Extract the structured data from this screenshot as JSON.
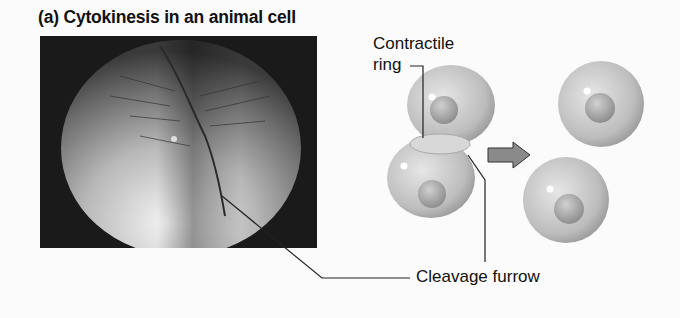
{
  "figure": {
    "title": "(a) Cytokinesis in an animal cell",
    "labels": {
      "contractile_ring_line1": "Contractile",
      "contractile_ring_line2": "ring",
      "cleavage_furrow": "Cleavage furrow"
    },
    "panels": [
      {
        "name": "micrograph",
        "description": "SEM of dividing animal cell with cleavage furrow"
      },
      {
        "name": "diagram",
        "description": "Dividing cell with contractile ring, arrow, two daughter cells"
      }
    ]
  }
}
